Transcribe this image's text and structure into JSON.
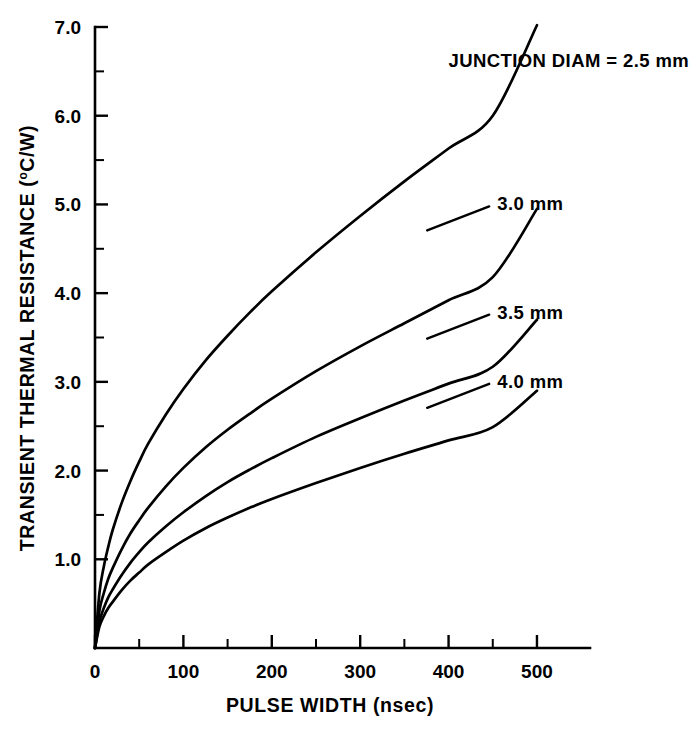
{
  "chart_data": {
    "type": "line",
    "title": "",
    "xlabel": "PULSE WIDTH (nsec)",
    "ylabel": "TRANSIENT THERMAL RESISTANCE (",
    "ylabel_sup": "o",
    "ylabel_tail": "C/W)",
    "ylabel_full": "TRANSIENT THERMAL RESISTANCE (oC/W)",
    "xlim": [
      0,
      560
    ],
    "ylim": [
      0,
      7.0
    ],
    "grid": false,
    "legend_position": "inline-annotations",
    "x_ticks_major": [
      0,
      100,
      200,
      300,
      400,
      500
    ],
    "x_ticks_minor": [
      50,
      150,
      250,
      350,
      450
    ],
    "x_tick_labels": [
      "0",
      "100",
      "200",
      "300",
      "400",
      "500"
    ],
    "y_ticks_major": [
      1.0,
      2.0,
      3.0,
      4.0,
      5.0,
      6.0,
      7.0
    ],
    "y_ticks_minor": [
      1.5,
      2.5,
      3.5,
      4.5,
      5.5,
      6.5
    ],
    "y_tick_labels": [
      "1.0",
      "2.0",
      "3.0",
      "4.0",
      "5.0",
      "6.0",
      "7.0"
    ],
    "x": [
      0,
      5,
      10,
      15,
      20,
      30,
      40,
      50,
      60,
      80,
      100,
      125,
      150,
      175,
      200,
      250,
      300,
      350,
      400,
      450,
      500
    ],
    "series": [
      {
        "name": "JUNCTION DIAM = 2.5 mm",
        "label": "JUNCTION DIAM = 2.5 mm",
        "values": [
          0,
          0.62,
          0.92,
          1.14,
          1.33,
          1.63,
          1.88,
          2.1,
          2.3,
          2.63,
          2.92,
          3.24,
          3.52,
          3.78,
          4.02,
          4.46,
          4.87,
          5.26,
          5.63,
          6.0,
          7.02
        ]
      },
      {
        "name": "3.0 mm",
        "label": "3.0 mm",
        "values": [
          0,
          0.42,
          0.62,
          0.78,
          0.9,
          1.11,
          1.29,
          1.44,
          1.58,
          1.82,
          2.03,
          2.26,
          2.46,
          2.64,
          2.81,
          3.12,
          3.4,
          3.66,
          3.92,
          4.18,
          4.95
        ]
      },
      {
        "name": "3.5 mm",
        "label": "3.5 mm",
        "values": [
          0,
          0.3,
          0.45,
          0.57,
          0.66,
          0.82,
          0.96,
          1.08,
          1.19,
          1.37,
          1.53,
          1.71,
          1.87,
          2.01,
          2.14,
          2.38,
          2.59,
          2.79,
          2.98,
          3.17,
          3.7
        ]
      },
      {
        "name": "4.0 mm",
        "label": "4.0 mm",
        "values": [
          0,
          0.24,
          0.36,
          0.45,
          0.52,
          0.65,
          0.76,
          0.85,
          0.94,
          1.08,
          1.21,
          1.35,
          1.47,
          1.58,
          1.68,
          1.86,
          2.03,
          2.19,
          2.34,
          2.49,
          2.9
        ]
      }
    ],
    "annotations": [
      {
        "text": "JUNCTION DIAM = 2.5 mm",
        "x": 400,
        "y": 6.62
      },
      {
        "text": "3.0 mm",
        "x": 455,
        "y": 5.0
      },
      {
        "text": "3.5 mm",
        "x": 455,
        "y": 3.78
      },
      {
        "text": "4.0 mm",
        "x": 455,
        "y": 3.0
      }
    ]
  },
  "colors": {
    "background": "#ffffff",
    "ink": "#000000"
  }
}
